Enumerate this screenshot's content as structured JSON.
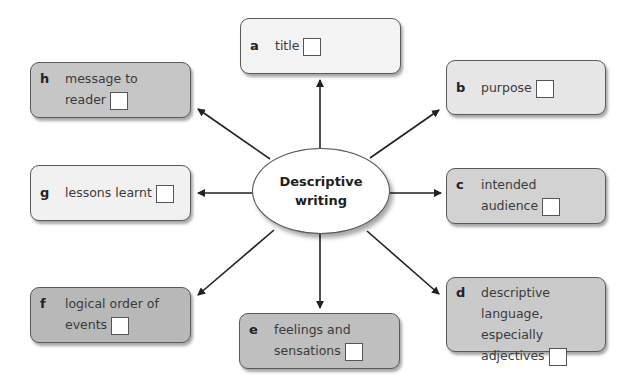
{
  "center": {
    "line1": "Descriptive",
    "line2": "writing"
  },
  "nodes": [
    {
      "id": "a",
      "letter": "a",
      "line1": "title",
      "line2": "",
      "line3": "",
      "fill": "#f4f4f4"
    },
    {
      "id": "b",
      "letter": "b",
      "line1": "purpose",
      "line2": "",
      "line3": "",
      "fill": "#e6e6e6"
    },
    {
      "id": "c",
      "letter": "c",
      "line1": "intended",
      "line2": "audience",
      "line3": "",
      "fill": "#d2d2d2"
    },
    {
      "id": "d",
      "letter": "d",
      "line1": "descriptive",
      "line2": "language, especially",
      "line3": "adjectives",
      "fill": "#cacaca"
    },
    {
      "id": "e",
      "letter": "e",
      "line1": "feelings and",
      "line2": "sensations",
      "line3": "",
      "fill": "#bfbfbf"
    },
    {
      "id": "f",
      "letter": "f",
      "line1": "logical order of",
      "line2": "events",
      "line3": "",
      "fill": "#b8b8b8"
    },
    {
      "id": "g",
      "letter": "g",
      "line1": "lessons learnt",
      "line2": "",
      "line3": "",
      "fill": "#f1f1f1"
    },
    {
      "id": "h",
      "letter": "h",
      "line1": "message to",
      "line2": "reader",
      "line3": "",
      "fill": "#c6c6c6"
    }
  ],
  "colors": {
    "stroke": "#222222",
    "border": "#5a5a5a",
    "background": "#ffffff"
  }
}
